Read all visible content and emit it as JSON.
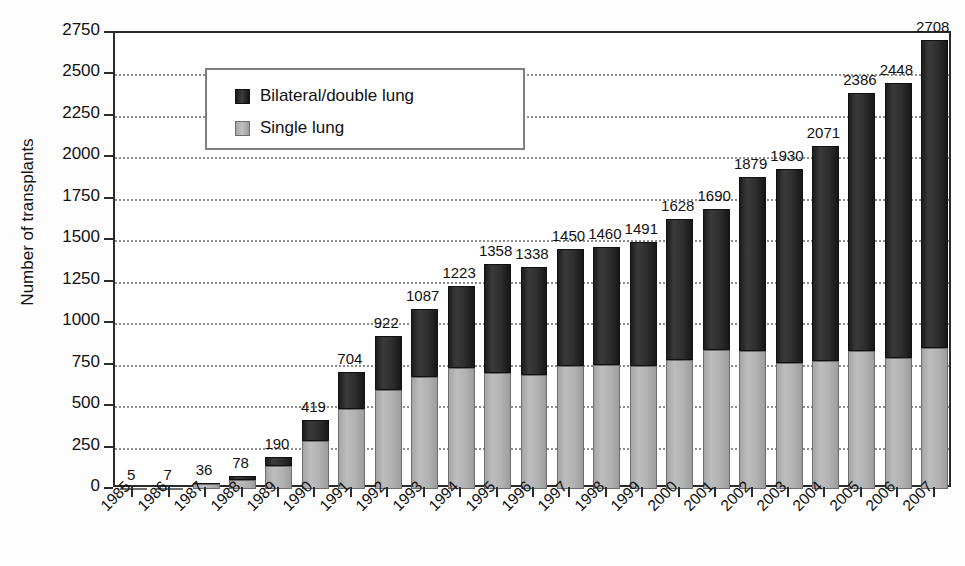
{
  "chart_data": {
    "type": "bar",
    "subtype": "stacked-bar",
    "title": "",
    "xlabel": "",
    "ylabel": "Number of transplants",
    "ylim": [
      0,
      2750
    ],
    "ytick_step": 250,
    "yticks": [
      0,
      250,
      500,
      750,
      1000,
      1250,
      1500,
      1750,
      2000,
      2250,
      2500,
      2750
    ],
    "ytick_labels": [
      "0",
      "250",
      "500",
      "750",
      "1000",
      "1250",
      "1500",
      "1750",
      "2000",
      "2250",
      "2500",
      "2750"
    ],
    "grid": "horizontal-dotted",
    "legend_position": "upper-left-inside",
    "categories": [
      "1985",
      "1986",
      "1987",
      "1988",
      "1989",
      "1990",
      "1991",
      "1992",
      "1993",
      "1994",
      "1995",
      "1996",
      "1997",
      "1998",
      "1999",
      "2000",
      "2001",
      "2002",
      "2003",
      "2004",
      "2005",
      "2006",
      "2007"
    ],
    "series": [
      {
        "name": "Single lung",
        "color": "#b2b2b2",
        "values": [
          4,
          6,
          30,
          55,
          140,
          290,
          480,
          595,
          675,
          730,
          700,
          685,
          740,
          745,
          740,
          775,
          840,
          830,
          760,
          770,
          835,
          790,
          850
        ]
      },
      {
        "name": "Bilateral/double lung",
        "color": "#2a2a2a",
        "values": [
          1,
          1,
          6,
          23,
          50,
          129,
          224,
          327,
          412,
          493,
          658,
          653,
          710,
          715,
          751,
          853,
          850,
          1049,
          1170,
          1301,
          1551,
          1658,
          1858
        ]
      }
    ],
    "totals": [
      5,
      7,
      36,
      78,
      190,
      419,
      704,
      922,
      1087,
      1223,
      1358,
      1338,
      1450,
      1460,
      1491,
      1628,
      1690,
      1879,
      1930,
      2071,
      2386,
      2448,
      2708
    ],
    "total_labels": [
      "5",
      "7",
      "36",
      "78",
      "190",
      "419",
      "704",
      "922",
      "1087",
      "1223",
      "1358",
      "1338",
      "1450",
      "1460",
      "1491",
      "1628",
      "1690",
      "1879",
      "1930",
      "2071",
      "2386",
      "2448",
      "2708"
    ],
    "legend": [
      {
        "label": "Bilateral/double lung",
        "swatch": "dark"
      },
      {
        "label": "Single lung",
        "swatch": "light"
      }
    ]
  },
  "colors": {
    "bar_dark": "#2a2a2a",
    "bar_light": "#b2b2b2",
    "axis": "#2b2b2b",
    "grid": "#8d8d8d",
    "text": "#111111",
    "background": "#ffffff"
  }
}
